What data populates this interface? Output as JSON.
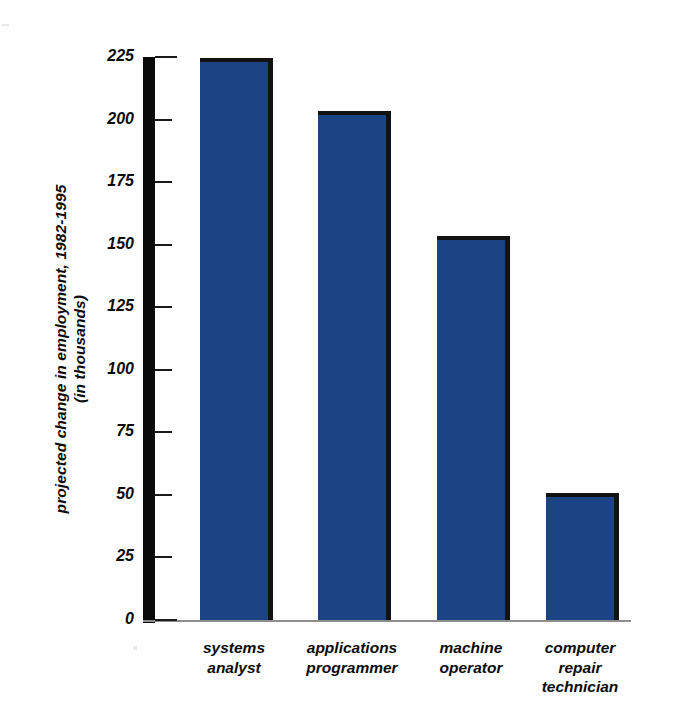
{
  "chart_data": {
    "type": "bar",
    "title": "",
    "subtitle": "",
    "xlabel": "",
    "ylabel": "projected change in employment, 1982-1995\n(in thousands)",
    "categories": [
      "systems\nanalyst",
      "applications\nprogrammer",
      "machine\noperator",
      "computer\nrepair\ntechnician"
    ],
    "values": [
      223,
      202,
      152,
      49
    ],
    "ylim": [
      0,
      225
    ],
    "yticks": [
      0,
      25,
      50,
      75,
      100,
      125,
      150,
      175,
      200,
      225
    ],
    "ytick_labels": [
      "0",
      "25",
      "50",
      "75",
      "100",
      "125",
      "150",
      "175",
      "200",
      "225"
    ],
    "grid": false,
    "legend": null,
    "legend_position": "none",
    "bar_color": "#1c4484",
    "bar_edge_color": "#121212",
    "axis_color": "#0a0a0a",
    "baseline_color": "#8e8e8e",
    "background_color": "#ffffff",
    "orientation": "vertical",
    "series": [
      {
        "name": "projected change in employment, 1982-1995 (in thousands)",
        "values": [
          223,
          202,
          152,
          49
        ]
      }
    ]
  }
}
